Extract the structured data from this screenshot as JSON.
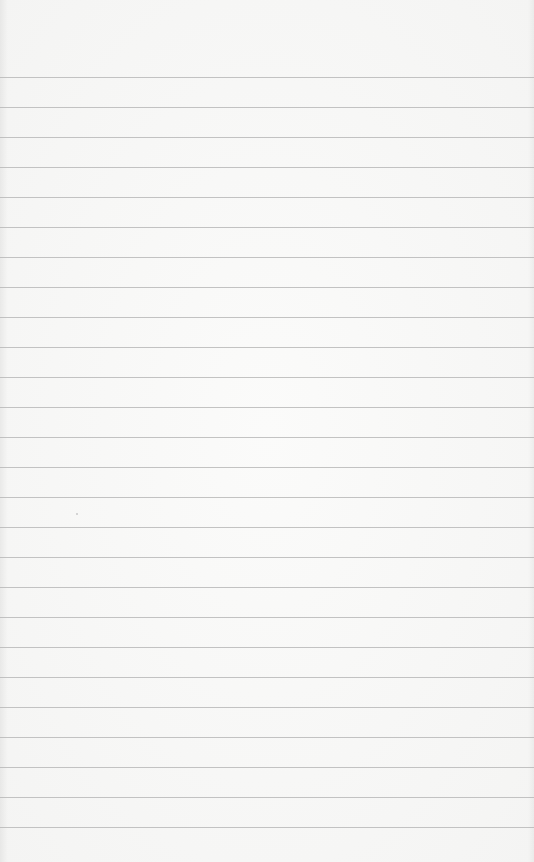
{
  "paper": {
    "type": "lined-paper",
    "background_color": "#f6f6f5",
    "line_color": "#b9b9b9",
    "first_line_y": 77,
    "line_spacing": 30,
    "line_count": 26
  }
}
